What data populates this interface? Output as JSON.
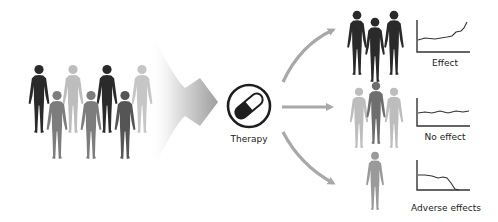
{
  "diagram": {
    "type": "precision-medicine-flow",
    "input_population": {
      "count": 7,
      "shades": [
        "#2a2a2a",
        "#bdbdbd",
        "#2a2a2a",
        "#bdbdbd",
        "#7a7a7a",
        "#7a7a7a",
        "#5a5a5a"
      ]
    },
    "center": {
      "icon": "pill-capsule-icon",
      "label": "Therapy"
    },
    "outcomes": [
      {
        "id": "effect",
        "label": "Effect",
        "people_count": 3,
        "shade": "#2a2a2a",
        "trend": "rising"
      },
      {
        "id": "no-effect",
        "label": "No effect",
        "people_count": 3,
        "shade": "#bdbdbd",
        "trend": "flat"
      },
      {
        "id": "adverse",
        "label": "Adverse effects",
        "people_count": 1,
        "shade": "#9a9a9a",
        "trend": "falling"
      }
    ],
    "colors": {
      "arrow": "#a8a8a8",
      "dark_figure": "#2a2a2a",
      "mid_figure": "#7a7a7a",
      "light_figure": "#bdbdbd",
      "axis": "#333333"
    }
  }
}
